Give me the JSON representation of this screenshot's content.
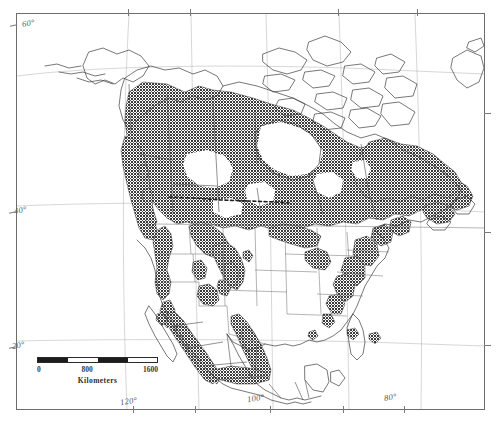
{
  "figure": {
    "type": "map",
    "kind": "species-distribution-range-map",
    "region": "North America",
    "projection_hint": "conic, curved graticule",
    "shading_legend": "dark stipple = distribution / range extent"
  },
  "graticule": {
    "latitude_labels": [
      {
        "label": "60°",
        "x": 22,
        "y": 18
      },
      {
        "label": "40°",
        "x": 14,
        "y": 205
      },
      {
        "label": "20°",
        "x": 12,
        "y": 340
      }
    ],
    "longitude_labels": [
      {
        "label": "120°",
        "x": 120,
        "y": 396
      },
      {
        "label": "100°",
        "x": 247,
        "y": 393
      },
      {
        "label": "80°",
        "x": 384,
        "y": 392
      }
    ],
    "top_ticks_x": [
      128,
      190,
      338,
      417
    ],
    "bottom_ticks_x": [
      133,
      195,
      270,
      343,
      404
    ],
    "left_ticks_y": [
      79,
      205,
      340
    ],
    "right_ticks_y": [
      113,
      232,
      345
    ]
  },
  "scalebar": {
    "unit": "Kilometers",
    "ticks": [
      {
        "label": "0",
        "pos": 0
      },
      {
        "label": "800",
        "pos": 50
      },
      {
        "label": "1600",
        "pos": 100
      }
    ],
    "segments": 4,
    "length_px": 121,
    "fill_color": "#1c1c1c"
  },
  "colors": {
    "shade": "#4a4a4a",
    "coastline": "#3d3d3d",
    "frame": "#6d6d6d",
    "background": "#ffffff",
    "dashed_border": "#222222"
  }
}
